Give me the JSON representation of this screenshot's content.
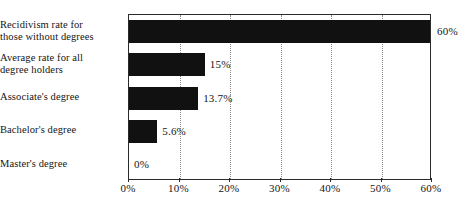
{
  "chart_data": {
    "type": "bar",
    "orientation": "horizontal",
    "title": "",
    "xlabel": "",
    "ylabel": "",
    "xlim": [
      0,
      60
    ],
    "grid": true,
    "legend": false,
    "categories": [
      "Recidivism rate for those without degrees",
      "Average rate for all degree holders",
      "Associate's degree",
      "Bachelor's degree",
      "Master's degree"
    ],
    "category_lines": [
      [
        "Recidivism rate for",
        "those without degrees"
      ],
      [
        "Average rate for all",
        "degree holders"
      ],
      [
        "Associate's degree"
      ],
      [
        "Bachelor's degree"
      ],
      [
        "Master's degree"
      ]
    ],
    "values": [
      60,
      15,
      13.7,
      5.6,
      0
    ],
    "data_labels": [
      "60%",
      "15%",
      "13.7%",
      "5.6%",
      "0%"
    ],
    "xticks": [
      0,
      10,
      20,
      30,
      40,
      50,
      60
    ],
    "xtick_labels": [
      "0%",
      "10%",
      "20%",
      "30%",
      "40%",
      "50%",
      "60%"
    ],
    "bar_color": "#111111",
    "grid_color": "#8a8a8a",
    "axis_color": "#2a2a2a",
    "background_color": "#ffffff"
  }
}
